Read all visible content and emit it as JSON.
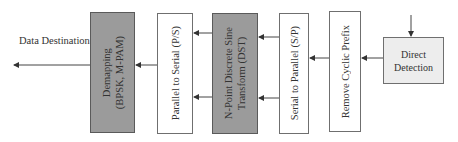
{
  "diagram": {
    "type": "block-diagram",
    "direction": "right-to-left",
    "output_label": "Data Destination",
    "blocks": [
      {
        "id": "demapping",
        "lines": [
          "Demapping",
          "(BPSK, M-PAM)"
        ],
        "fill": "#9b9b9b"
      },
      {
        "id": "p2s",
        "lines": [
          "Parallel to Serial (P/S)"
        ],
        "fill": "#ffffff"
      },
      {
        "id": "dst",
        "lines": [
          "N-Point Discrete Sine",
          "Transform (DST)"
        ],
        "fill": "#9b9b9b"
      },
      {
        "id": "s2p",
        "lines": [
          "Serial to Parallel (S/P)"
        ],
        "fill": "#ffffff"
      },
      {
        "id": "remove_cp",
        "lines": [
          "Remove Cyclic Prefix"
        ],
        "fill": "#ffffff"
      },
      {
        "id": "direct_detection",
        "lines": [
          "Direct",
          "Detection"
        ],
        "fill": "#ededed"
      }
    ],
    "connections": [
      {
        "from": "input",
        "to": "direct_detection"
      },
      {
        "from": "direct_detection",
        "to": "remove_cp"
      },
      {
        "from": "remove_cp",
        "to": "s2p"
      },
      {
        "from": "s2p",
        "to": "dst",
        "count": 2
      },
      {
        "from": "dst",
        "to": "p2s",
        "count": 2
      },
      {
        "from": "p2s",
        "to": "demapping"
      },
      {
        "from": "demapping",
        "to": "data_destination"
      }
    ]
  }
}
